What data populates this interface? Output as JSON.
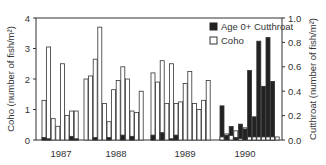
{
  "chart_data": {
    "type": "bar",
    "title": "",
    "xlabel": "",
    "ylabel": "Coho (number of fish/m²)",
    "ylabel_right": "Cutthroat (number of fish/m²)",
    "ylim": [
      0,
      4
    ],
    "ylim_right": [
      0,
      1.0
    ],
    "yticks": [
      "0",
      "1",
      "2",
      "3",
      "4"
    ],
    "yticks_right": [
      "0.0",
      "0.2",
      "0.4",
      "0.6",
      "0.8",
      "1.0"
    ],
    "legend": {
      "position": "upper right",
      "entries": [
        {
          "label": "Age 0+ Cutthroat",
          "color": "#222222"
        },
        {
          "label": "Coho",
          "color": "#ffffff"
        }
      ]
    },
    "groups": [
      {
        "year": "1987",
        "coho": [
          1.3,
          3.05,
          0.7,
          0.45,
          2.5,
          0.8,
          0.95,
          0.95
        ],
        "cutthroat": [
          0.02,
          0.01,
          0.0,
          0.0,
          0.0,
          0.0,
          0.03,
          0.01
        ]
      },
      {
        "year": "1988",
        "coho": [
          2.0,
          2.1,
          2.65,
          3.7,
          1.2,
          0.6,
          1.65,
          1.95,
          2.4,
          2.0,
          0.95,
          0.9,
          1.6
        ],
        "cutthroat": [
          0.0,
          0.0,
          0.02,
          0.0,
          0.0,
          0.02,
          0.0,
          0.0,
          0.04,
          0.0,
          0.03,
          0.0,
          0.0
        ]
      },
      {
        "year": "1989",
        "coho": [
          2.2,
          1.9,
          2.6,
          1.2,
          2.5,
          1.2,
          1.25,
          1.85,
          2.25,
          1.2,
          1.0,
          1.3,
          1.95
        ],
        "cutthroat": [
          0.04,
          0.0,
          0.06,
          0.0,
          0.01,
          0.04,
          0.0,
          0.0,
          0.0,
          0.0,
          0.0,
          0.0,
          0.0
        ]
      },
      {
        "year": "1990",
        "coho": [
          0.1,
          0.2,
          0.15,
          0.3,
          0.05,
          0.4,
          0.1,
          0.1,
          0.1,
          0.1,
          0.1,
          0.1,
          0.1
        ],
        "cutthroat": [
          0.28,
          0.04,
          0.11,
          0.02,
          0.13,
          0.09,
          0.57,
          0.19,
          0.81,
          0.44,
          0.84,
          0.48,
          0.0
        ]
      }
    ]
  }
}
